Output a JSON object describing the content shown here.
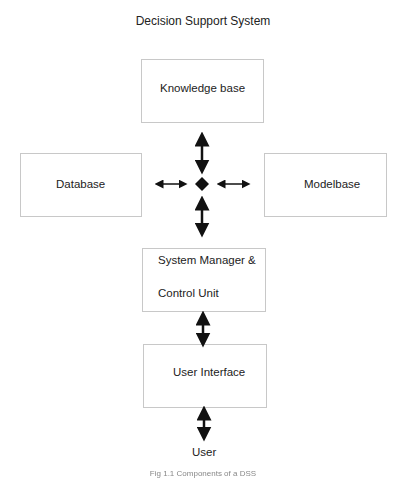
{
  "diagram": {
    "title": "Decision Support System",
    "nodes": {
      "knowledge_base": "Knowledge base",
      "database": "Database",
      "modelbase": "Modelbase",
      "system_manager_line1": "System Manager &",
      "system_manager_line2": "Control Unit",
      "user_interface": "User Interface",
      "user": "User"
    },
    "hub": "diamond",
    "edges": [
      {
        "from": "hub",
        "to": "knowledge_base",
        "type": "bidirectional"
      },
      {
        "from": "hub",
        "to": "database",
        "type": "bidirectional"
      },
      {
        "from": "hub",
        "to": "modelbase",
        "type": "bidirectional"
      },
      {
        "from": "hub",
        "to": "system_manager",
        "type": "bidirectional"
      },
      {
        "from": "system_manager",
        "to": "user_interface",
        "type": "bidirectional"
      },
      {
        "from": "user_interface",
        "to": "user",
        "type": "bidirectional"
      }
    ],
    "caption": "Fig 1.1 Components of a DSS"
  }
}
